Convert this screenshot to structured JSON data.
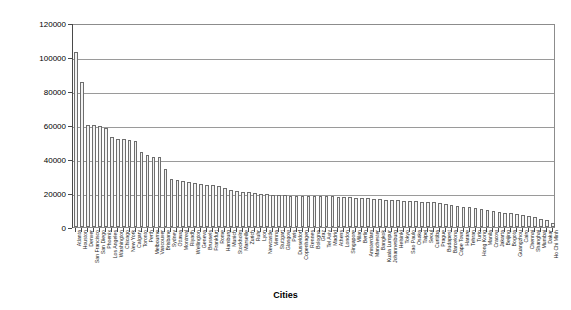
{
  "chart_data": {
    "type": "bar",
    "title": "",
    "xlabel": "Cities",
    "ylabel": "",
    "ylim": [
      0,
      120000
    ],
    "ytick_labels": [
      "0",
      "20000",
      "40000",
      "60000",
      "80000",
      "100000",
      "120000"
    ],
    "ytick_values": [
      0,
      20000,
      40000,
      60000,
      80000,
      100000,
      120000
    ],
    "grid": true,
    "legend": "none",
    "categories": [
      "Atlanta",
      "Houston",
      "Denver",
      "San Francisco",
      "San Diego",
      "Phoenix",
      "Los Angeles",
      "Washington",
      "Chicago",
      "New York",
      "Calgary",
      "Toronto",
      "Perth",
      "Melbourne",
      "Vancouver",
      "Brisbane",
      "Sydney",
      "Ottawa",
      "Montreal",
      "Riyadh",
      "Wellington",
      "Geneva",
      "Brussels",
      "Frankfurt",
      "Rome",
      "Hamburg",
      "Munich",
      "Stockholm",
      "Marseille",
      "Zurich",
      "Ruhr",
      "Lyon",
      "Newcastle",
      "Vienna",
      "Stuttgart",
      "Glasgow",
      "Paris",
      "Dusseldorf",
      "Copenhagen",
      "Rennes",
      "Bologna",
      "Graz",
      "Tel Aviv",
      "Madrid",
      "Athens",
      "London",
      "Singapore",
      "Milan",
      "Berlin",
      "Amsterdam",
      "Manchester",
      "Bangkok",
      "Kuala Lumpur",
      "Johannesburg",
      "Helsinki",
      "Tokyo",
      "Sao Paulo",
      "Osaka",
      "Taipei",
      "Seoul",
      "Curitiba",
      "Prague",
      "Budapest",
      "Barcelona",
      "Cape Town",
      "Harare",
      "Tehran",
      "Turin",
      "Hong Kong",
      "Manila",
      "Cracow",
      "Jakarta",
      "Beijing",
      "Bogota",
      "Guangzhou",
      "Cairo",
      "Chennai",
      "Shanghai",
      "Mumbai",
      "Dakar",
      "Ho Chi Minh"
    ],
    "values": [
      103000,
      85500,
      60000,
      60000,
      59500,
      58500,
      53000,
      52000,
      51500,
      51000,
      50500,
      44000,
      42500,
      41000,
      41000,
      34000,
      28500,
      27500,
      27000,
      26500,
      26000,
      25500,
      25000,
      24500,
      24000,
      23000,
      22000,
      21000,
      20500,
      20500,
      20000,
      19500,
      19500,
      19000,
      19000,
      19000,
      18500,
      18500,
      18500,
      18500,
      18000,
      18000,
      18000,
      18000,
      17500,
      17500,
      17500,
      17000,
      17000,
      17000,
      16500,
      16500,
      16000,
      16000,
      16000,
      15500,
      15500,
      15500,
      15000,
      15000,
      14500,
      14000,
      13500,
      13000,
      12500,
      12000,
      11500,
      11000,
      10500,
      10000,
      9500,
      9000,
      8500,
      8000,
      7500,
      7000,
      6500,
      6000,
      5000,
      4000,
      2500
    ]
  }
}
